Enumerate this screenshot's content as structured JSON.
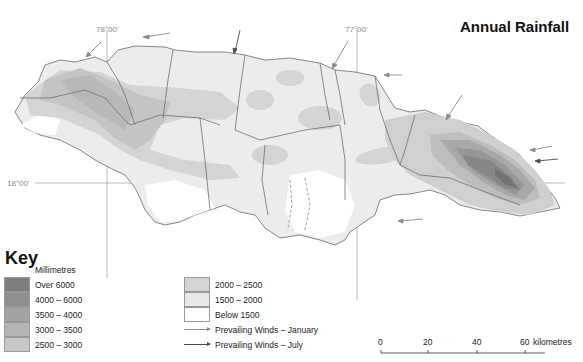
{
  "title": "Annual Rainfall",
  "coordinates": {
    "lon_west": "78°00'",
    "lon_east": "77°00'",
    "lat": "18°00'"
  },
  "key": {
    "title": "Key",
    "unit": "Millimetres",
    "rainfall_classes": [
      {
        "label": "Over 6000",
        "color": "#7d7d7d"
      },
      {
        "label": "4000  –  6000",
        "color": "#8f8f8f"
      },
      {
        "label": "3500  –  4000",
        "color": "#a3a3a3"
      },
      {
        "label": "3000  –  3500",
        "color": "#b4b4b4"
      },
      {
        "label": "2500  –  3000",
        "color": "#c8c8c8"
      },
      {
        "label": "2000  –  2500",
        "color": "#d4d4d4"
      },
      {
        "label": "1500  –  2000",
        "color": "#e8e8e8"
      },
      {
        "label": "Below 1500",
        "color": "#ffffff"
      }
    ],
    "winds": [
      {
        "label": "Prevailing Winds  –  January",
        "color": "#8a8a8a"
      },
      {
        "label": "Prevailing Winds  –  July",
        "color": "#4a4a4a"
      }
    ]
  },
  "scale_bar": {
    "ticks": [
      "0",
      "20",
      "40",
      "60"
    ],
    "unit": "kilometres"
  }
}
